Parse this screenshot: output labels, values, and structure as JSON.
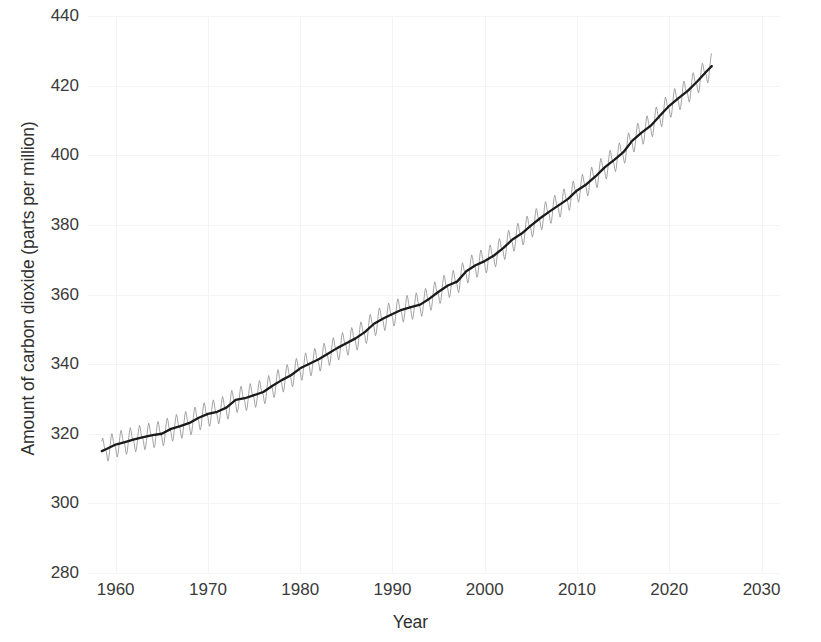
{
  "chart_data": {
    "type": "line",
    "title": "",
    "xlabel": "Year",
    "ylabel": "Amount of carbon dioxide (parts per million)",
    "xlim": [
      1957,
      2032
    ],
    "ylim": [
      280,
      440
    ],
    "xticks": [
      1960,
      1970,
      1980,
      1990,
      2000,
      2010,
      2020,
      2030
    ],
    "yticks": [
      280,
      300,
      320,
      340,
      360,
      380,
      400,
      420,
      440
    ],
    "grid": true,
    "legend": "none",
    "colors": {
      "monthly_line": "#9a9a9a",
      "trend_line": "#1a1a1a",
      "grid": "#f4f4f4",
      "text": "#3a3a3a",
      "background": "#ffffff"
    },
    "series": [
      {
        "name": "Monthly mean CO2 (seasonal cycle)",
        "color": "#9a9a9a",
        "linewidth": 0.9,
        "seasonal_amplitude_ppm": 3.1,
        "description": "Monthly mean atmospheric CO2 at Mauna Loa with annual sawtooth seasonal oscillation superimposed on the trend"
      },
      {
        "name": "Seasonally adjusted trend",
        "color": "#1a1a1a",
        "linewidth": 2.3,
        "x": [
          1958.5,
          1959,
          1960,
          1961,
          1962,
          1963,
          1964,
          1965,
          1966,
          1967,
          1968,
          1969,
          1970,
          1971,
          1972,
          1973,
          1974,
          1975,
          1976,
          1977,
          1978,
          1979,
          1980,
          1981,
          1982,
          1983,
          1984,
          1985,
          1986,
          1987,
          1988,
          1989,
          1990,
          1991,
          1992,
          1993,
          1994,
          1995,
          1996,
          1997,
          1998,
          1999,
          2000,
          2001,
          2002,
          2003,
          2004,
          2005,
          2006,
          2007,
          2008,
          2009,
          2010,
          2011,
          2012,
          2013,
          2014,
          2015,
          2016,
          2017,
          2018,
          2019,
          2020,
          2021,
          2022,
          2023,
          2024,
          2024.6
        ],
        "values": [
          315.0,
          315.6,
          316.9,
          317.6,
          318.4,
          319.0,
          319.6,
          320.0,
          321.4,
          322.2,
          323.1,
          324.6,
          325.7,
          326.3,
          327.5,
          329.7,
          330.2,
          331.1,
          332.0,
          333.8,
          335.4,
          336.8,
          338.8,
          340.1,
          341.4,
          343.0,
          344.6,
          346.0,
          347.4,
          349.2,
          351.6,
          353.1,
          354.4,
          355.6,
          356.4,
          357.1,
          358.8,
          360.8,
          362.6,
          363.7,
          366.7,
          368.4,
          369.6,
          371.2,
          373.3,
          375.8,
          377.5,
          379.8,
          381.9,
          383.8,
          385.6,
          387.4,
          389.9,
          391.6,
          393.9,
          396.5,
          398.6,
          400.8,
          404.2,
          406.5,
          408.5,
          411.4,
          414.2,
          416.4,
          418.5,
          421.1,
          424.0,
          425.6
        ]
      }
    ],
    "source_note": ""
  },
  "axes": {
    "y_title": "Amount of carbon dioxide (parts per million)",
    "x_title": "Year",
    "y_tick_labels": [
      "440",
      "420",
      "400",
      "380",
      "360",
      "340",
      "320",
      "300",
      "280"
    ],
    "x_tick_labels": [
      "1960",
      "1970",
      "1980",
      "1990",
      "2000",
      "2010",
      "2020",
      "2030"
    ]
  }
}
